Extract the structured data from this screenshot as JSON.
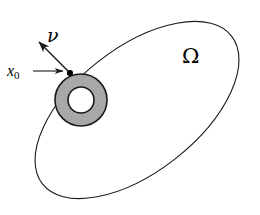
{
  "figure": {
    "kind": "math-diagram",
    "width": 260,
    "height": 215,
    "background_color": "#ffffff"
  },
  "labels": {
    "domain": "Ω",
    "normal_vector": "ν",
    "point_base": "x",
    "point_subscript": "0"
  },
  "colors": {
    "stroke": "#1a1a1a",
    "annulus_fill": "#a8a8a8",
    "interior_fill": "#ffffff",
    "point_marker": "#000000",
    "arrow": "#1a1a1a"
  },
  "geometry": {
    "ellipse": {
      "center_x": 137,
      "center_y": 110,
      "semi_major": 120,
      "semi_minor": 62,
      "rotation_deg": -38,
      "stroke_width": 1.1
    },
    "annulus": {
      "center_x": 81,
      "center_y": 100,
      "outer_radius": 26,
      "inner_radius": 13,
      "stroke_width": 1.6
    },
    "tangent_point": {
      "x": 70,
      "y": 73,
      "marker_radius": 3.1
    },
    "normal_arrow": {
      "from_x": 70,
      "from_y": 73,
      "to_x": 39,
      "to_y": 42,
      "stroke_width": 1.5
    },
    "pointer_arrow": {
      "from_x": 33,
      "from_y": 71,
      "to_x": 64,
      "to_y": 71,
      "stroke_width": 1.1
    }
  }
}
